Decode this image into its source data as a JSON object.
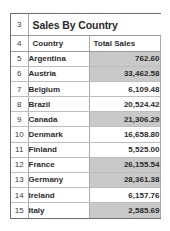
{
  "sheet": {
    "title": "Sales By Country",
    "title_row_number": "3",
    "header_row_number": "4",
    "columns": [
      "Country",
      "Total Sales"
    ],
    "shaded_color": "#c9c9c9",
    "rows": [
      {
        "row_number": "5",
        "country": "Argentina",
        "total_sales": "762.60",
        "shaded": true
      },
      {
        "row_number": "6",
        "country": "Austria",
        "total_sales": "33,462.58",
        "shaded": true
      },
      {
        "row_number": "7",
        "country": "Belgium",
        "total_sales": "6,109.48",
        "shaded": false
      },
      {
        "row_number": "8",
        "country": "Brazil",
        "total_sales": "20,524.42",
        "shaded": false
      },
      {
        "row_number": "9",
        "country": "Canada",
        "total_sales": "21,306.29",
        "shaded": true
      },
      {
        "row_number": "10",
        "country": "Denmark",
        "total_sales": "16,658.80",
        "shaded": false
      },
      {
        "row_number": "11",
        "country": "Finland",
        "total_sales": "5,525.00",
        "shaded": false
      },
      {
        "row_number": "12",
        "country": "France",
        "total_sales": "26,155.54",
        "shaded": true
      },
      {
        "row_number": "13",
        "country": "Germany",
        "total_sales": "28,361.38",
        "shaded": true
      },
      {
        "row_number": "14",
        "country": "Ireland",
        "total_sales": "6,157.76",
        "shaded": false
      },
      {
        "row_number": "15",
        "country": "Italy",
        "total_sales": "2,585.69",
        "shaded": true
      }
    ]
  }
}
